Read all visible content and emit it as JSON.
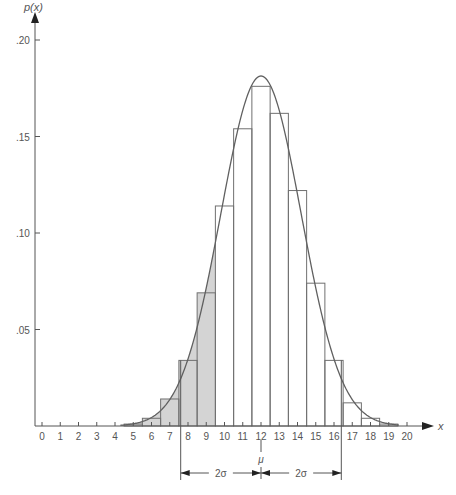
{
  "chart_data": {
    "type": "bar",
    "title": "",
    "xlabel": "x",
    "ylabel": "p(x)",
    "x": [
      0,
      1,
      2,
      3,
      4,
      5,
      6,
      7,
      8,
      9,
      10,
      11,
      12,
      13,
      14,
      15,
      16,
      17,
      18,
      19,
      20
    ],
    "values": [
      0,
      0,
      0,
      0,
      0,
      0.001,
      0.004,
      0.014,
      0.034,
      0.069,
      0.114,
      0.154,
      0.176,
      0.162,
      0.122,
      0.074,
      0.034,
      0.012,
      0.004,
      0.001,
      0
    ],
    "shaded_bars": [
      5,
      6,
      7,
      8,
      9
    ],
    "ylim": [
      0,
      0.21
    ],
    "xlim": [
      0,
      20
    ],
    "ytick_labels": [
      ".05",
      ".10",
      ".15",
      ".20"
    ],
    "yticks": [
      0.05,
      0.1,
      0.15,
      0.2
    ],
    "xtick_labels": [
      "0",
      "1",
      "2",
      "3",
      "4",
      "5",
      "6",
      "7",
      "8",
      "9",
      "10",
      "11",
      "12",
      "13",
      "14",
      "15",
      "16",
      "17",
      "18",
      "19",
      "20"
    ],
    "overlay": "normal curve approximation",
    "mean": 12,
    "annotations": {
      "mu_label": "μ",
      "left_interval_label": "2σ",
      "right_interval_label": "2σ",
      "interval_left": 7.6,
      "interval_right": 16.4
    },
    "grid": false,
    "legend": null
  },
  "colors": {
    "axis": "#555555",
    "bar_stroke": "#707070",
    "shade": "#d4d4d4",
    "curve": "#606060"
  }
}
